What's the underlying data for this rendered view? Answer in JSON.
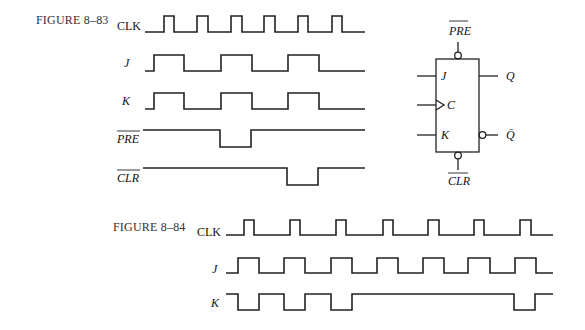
{
  "figures": [
    {
      "id": "8-83",
      "title": "FIGURE 8–83",
      "signals": [
        {
          "name": "CLK",
          "label": "CLK",
          "italic": false,
          "overbar": false,
          "low_y": 32,
          "high_y": 16,
          "start_x": 145,
          "end_x": 365,
          "initial": 0,
          "transitions": [
            164,
            174,
            197,
            208,
            231,
            242,
            264,
            275,
            298,
            308,
            332,
            342
          ]
        },
        {
          "name": "J",
          "label": "J",
          "italic": true,
          "overbar": false,
          "low_y": 71,
          "high_y": 55,
          "start_x": 145,
          "end_x": 365,
          "initial": 0,
          "transitions": [
            154,
            184,
            221,
            252,
            288,
            319
          ]
        },
        {
          "name": "K",
          "label": "K",
          "italic": true,
          "overbar": false,
          "low_y": 109,
          "high_y": 93,
          "start_x": 145,
          "end_x": 365,
          "initial": 0,
          "transitions": [
            154,
            184,
            221,
            252,
            288,
            319
          ]
        },
        {
          "name": "PRE",
          "label": "PRE",
          "italic": true,
          "overbar": true,
          "low_y": 147,
          "high_y": 130,
          "start_x": 143,
          "end_x": 365,
          "initial": 1,
          "transitions": [
            220,
            251
          ]
        },
        {
          "name": "CLR",
          "label": "CLR",
          "italic": true,
          "overbar": true,
          "low_y": 185,
          "high_y": 168,
          "start_x": 143,
          "end_x": 365,
          "initial": 1,
          "transitions": [
            287,
            318
          ]
        }
      ],
      "flipflop": {
        "inputs": [
          "J",
          "C",
          "K"
        ],
        "outputs": [
          "Q",
          "Q̄"
        ],
        "preset": "PRE",
        "clear": "CLR"
      }
    },
    {
      "id": "8-84",
      "title": "FIGURE 8–84",
      "signals": [
        {
          "name": "CLK",
          "label": "CLK",
          "italic": false,
          "overbar": false,
          "low_y": 235,
          "high_y": 220,
          "start_x": 226,
          "end_x": 553,
          "initial": 0,
          "transitions": [
            244,
            254,
            290,
            300,
            336,
            346,
            383,
            393,
            428,
            439,
            474,
            484,
            520,
            531
          ]
        },
        {
          "name": "J",
          "label": "J",
          "italic": true,
          "overbar": false,
          "low_y": 273,
          "high_y": 258,
          "start_x": 226,
          "end_x": 553,
          "initial": 0,
          "transitions": [
            238,
            259,
            284,
            305,
            331,
            352,
            377,
            398,
            423,
            444,
            468,
            490,
            515,
            536
          ]
        },
        {
          "name": "K",
          "label": "K",
          "italic": true,
          "overbar": false,
          "low_y": 310,
          "high_y": 294,
          "start_x": 226,
          "end_x": 553,
          "initial": 1,
          "transitions": [
            238,
            259,
            284,
            305,
            331,
            352,
            514,
            535
          ]
        }
      ]
    }
  ]
}
